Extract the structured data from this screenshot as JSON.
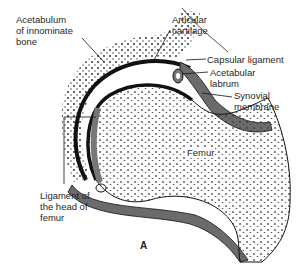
{
  "figure": {
    "letter": "A"
  },
  "labels": {
    "acetabulum": "Acetabulum\nof innominate\nbone",
    "articular_cartilage": "Articular\ncartilage",
    "capsular_ligament": "Capsular ligament",
    "acetabular_labrum": "Acetabular\nlabrum",
    "synovial_membrane": "Synovial\nmembrane",
    "femur": "Femur",
    "ligament_head_femur": "Ligament of\nthe head of\nfemur"
  },
  "colors": {
    "ink": "#111111",
    "capsule_gray": "#6b6b6b",
    "bone_fill": "#ffffff"
  }
}
